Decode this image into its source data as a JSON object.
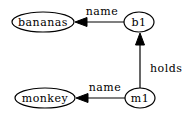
{
  "diagram": {
    "type": "directed-graph",
    "nodes": [
      {
        "id": "bananas",
        "label": "bananas",
        "shape": "ellipse",
        "cx": 43,
        "cy": 22,
        "rx": 31,
        "ry": 10
      },
      {
        "id": "b1",
        "label": "b1",
        "shape": "ellipse",
        "cx": 139,
        "cy": 22,
        "rx": 15,
        "ry": 10
      },
      {
        "id": "monkey",
        "label": "monkey",
        "shape": "ellipse",
        "cx": 45,
        "cy": 98,
        "rx": 30,
        "ry": 10
      },
      {
        "id": "m1",
        "label": "m1",
        "shape": "ellipse",
        "cx": 140,
        "cy": 98,
        "rx": 15,
        "ry": 10
      }
    ],
    "edges": [
      {
        "from": "b1",
        "to": "bananas",
        "label": "name"
      },
      {
        "from": "m1",
        "to": "monkey",
        "label": "name"
      },
      {
        "from": "m1",
        "to": "b1",
        "label": "holds"
      }
    ],
    "labels": {
      "node_bananas": "bananas",
      "node_b1": "b1",
      "node_monkey": "monkey",
      "node_m1": "m1",
      "edge_b1_bananas": "name",
      "edge_m1_monkey": "name",
      "edge_m1_b1": "holds"
    },
    "colors": {
      "stroke": "#000000",
      "background": "#ffffff"
    }
  }
}
